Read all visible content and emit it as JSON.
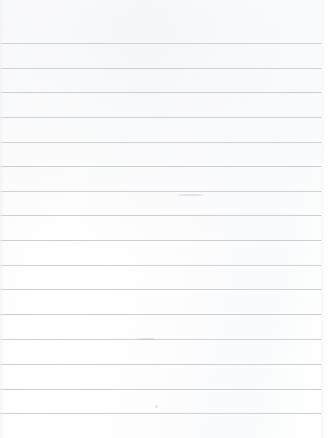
{
  "document": {
    "kind": "ruled-paper-sheet",
    "description": "Blank sheet of lined notebook paper",
    "width_px": 328,
    "height_px": 438,
    "background_color": "#fdfdfd",
    "rule_color": "#c9cbcf",
    "rule_thickness_px": 1,
    "rule_spacing_px": 24.7,
    "rule_count": 16,
    "first_rule_y_px": 43,
    "rule_start_x_px": 0,
    "rule_end_x_px": 321,
    "top_margin_px": 43,
    "bottom_margin_px": 25,
    "written_text": "",
    "header_text": "",
    "page_number": "",
    "rules": [
      {
        "index": 1,
        "y": 43,
        "x": 0,
        "width": 321
      },
      {
        "index": 2,
        "y": 68,
        "x": 0,
        "width": 322
      },
      {
        "index": 3,
        "y": 92,
        "x": 0,
        "width": 322
      },
      {
        "index": 4,
        "y": 117,
        "x": 0,
        "width": 322
      },
      {
        "index": 5,
        "y": 142,
        "x": 0,
        "width": 322
      },
      {
        "index": 6,
        "y": 166,
        "x": 0,
        "width": 322
      },
      {
        "index": 7,
        "y": 191,
        "x": 0,
        "width": 322
      },
      {
        "index": 8,
        "y": 215,
        "x": 0,
        "width": 322
      },
      {
        "index": 9,
        "y": 240,
        "x": 0,
        "width": 322
      },
      {
        "index": 10,
        "y": 265,
        "x": 0,
        "width": 322
      },
      {
        "index": 11,
        "y": 289,
        "x": 0,
        "width": 322
      },
      {
        "index": 12,
        "y": 314,
        "x": 0,
        "width": 322
      },
      {
        "index": 13,
        "y": 339,
        "x": 0,
        "width": 322
      },
      {
        "index": 14,
        "y": 364,
        "x": 0,
        "width": 322
      },
      {
        "index": 15,
        "y": 389,
        "x": 0,
        "width": 322
      },
      {
        "index": 16,
        "y": 413,
        "x": 0,
        "width": 322
      }
    ],
    "marks": [
      {
        "x": 178,
        "y": 194,
        "w": 26,
        "h": 2
      },
      {
        "x": 137,
        "y": 338,
        "w": 18,
        "h": 2
      },
      {
        "x": 155,
        "y": 405,
        "w": 3,
        "h": 3
      }
    ]
  }
}
